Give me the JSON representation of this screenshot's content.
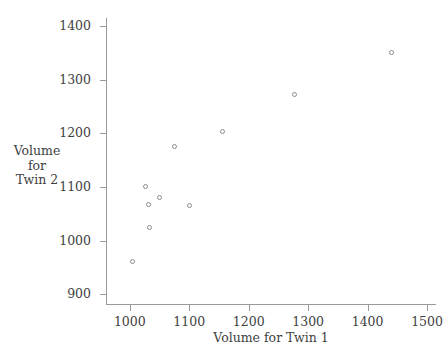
{
  "chart_data": {
    "type": "scatter",
    "title": "",
    "xlabel": "Volume for Twin 1",
    "ylabel_lines": [
      "Volume",
      "for",
      "Twin 2"
    ],
    "ylabel": "Volume for Twin 2",
    "xlim": [
      960,
      1515
    ],
    "ylim": [
      880,
      1415
    ],
    "xticks": [
      1000,
      1100,
      1200,
      1300,
      1400,
      1500
    ],
    "yticks": [
      900,
      1000,
      1100,
      1200,
      1300,
      1400
    ],
    "xtick_labels": [
      "1000",
      "1100",
      "1200",
      "1300",
      "1400",
      "1500"
    ],
    "ytick_labels": [
      "900",
      "1000",
      "1100",
      "1200",
      "1300",
      "1400"
    ],
    "grid": false,
    "legend": null,
    "marker": "open-circle",
    "marker_color": "#8d8d8d",
    "axis_color": "#9a9a9a",
    "points": [
      {
        "x": 1005,
        "y": 962
      },
      {
        "x": 1027,
        "y": 1100
      },
      {
        "x": 1032,
        "y": 1068
      },
      {
        "x": 1050,
        "y": 1080
      },
      {
        "x": 1033,
        "y": 1025
      },
      {
        "x": 1076,
        "y": 1175
      },
      {
        "x": 1101,
        "y": 1066
      },
      {
        "x": 1156,
        "y": 1204
      },
      {
        "x": 1277,
        "y": 1272
      },
      {
        "x": 1440,
        "y": 1350
      }
    ]
  }
}
